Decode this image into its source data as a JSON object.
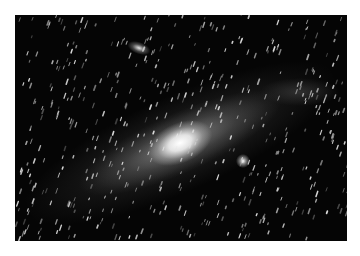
{
  "image": {
    "subject": "Andromeda galaxy astrophotograph",
    "style": "grayscale",
    "colors": {
      "page_background": "#ffffff",
      "sky": "#050505",
      "core": "#ffffff",
      "disk": "#9a9a9a",
      "stars": "#e6e6e6"
    },
    "frame": {
      "x": 15,
      "y": 15,
      "width": 332,
      "height": 226
    },
    "features": [
      {
        "name": "galaxy-core",
        "x": 180,
        "y": 143
      },
      {
        "name": "companion-galaxy-upper-left",
        "x": 139,
        "y": 48
      },
      {
        "name": "companion-bright-star",
        "x": 243,
        "y": 161
      }
    ]
  }
}
